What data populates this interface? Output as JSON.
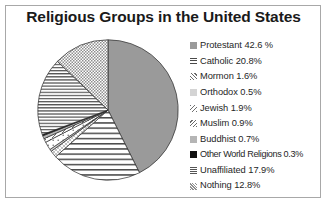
{
  "chart_data": {
    "type": "pie",
    "title": "Religious Groups in the United States",
    "xlabel": "",
    "ylabel": "",
    "legend_position": "right",
    "grid": false,
    "start_angle_deg": 0,
    "direction": "clockwise",
    "categories": [
      "Protestant",
      "Catholic",
      "Mormon",
      "Orthodox",
      "Jewish",
      "Muslim",
      "Buddhist",
      "Other World Religions",
      "Unaffiliated",
      "Nothing"
    ],
    "values": [
      42.6,
      20.8,
      1.6,
      0.5,
      1.9,
      0.9,
      0.7,
      0.3,
      17.9,
      12.8
    ],
    "slices": [
      {
        "label": "Protestant",
        "value": 42.6,
        "legend_text": "Protestant 42.6 %",
        "pattern": "solid-gray",
        "fill": "#9a9a9a"
      },
      {
        "label": "Catholic",
        "value": 20.8,
        "legend_text": "Catholic 20.8%",
        "pattern": "horizontal-lines-wide",
        "fill": "#ffffff"
      },
      {
        "label": "Mormon",
        "value": 1.6,
        "legend_text": "Mormon 1.6%",
        "pattern": "diagonal-dots",
        "fill": "#ffffff"
      },
      {
        "label": "Orthodox",
        "value": 0.5,
        "legend_text": "Orthodox 0.5%",
        "pattern": "light-gray",
        "fill": "#d4d4d4"
      },
      {
        "label": "Jewish",
        "value": 1.9,
        "legend_text": "Jewish 1.9%",
        "pattern": "sparse-dots",
        "fill": "#ffffff"
      },
      {
        "label": "Muslim",
        "value": 0.9,
        "legend_text": "Muslim 0.9%",
        "pattern": "diagonal-dash",
        "fill": "#ffffff"
      },
      {
        "label": "Buddhist",
        "value": 0.7,
        "legend_text": "Buddhist 0.7%",
        "pattern": "mid-gray",
        "fill": "#b5b5b5"
      },
      {
        "label": "Other World Religions",
        "value": 0.3,
        "legend_text": "Other World Religions 0.3%",
        "pattern": "solid-black",
        "fill": "#111111"
      },
      {
        "label": "Unaffiliated",
        "value": 17.9,
        "legend_text": "Unaffiliated 17.9%",
        "pattern": "horizontal-lines-dense",
        "fill": "#ffffff"
      },
      {
        "label": "Nothing",
        "value": 12.8,
        "legend_text": "Nothing 12.8%",
        "pattern": "checkered-fine",
        "fill": "#ffffff"
      }
    ]
  },
  "colors": {
    "border": "#a8a8a8",
    "title": "#1a1a1a",
    "legend_text": "#262626",
    "outline": "#2b2b2b",
    "background": "#ffffff"
  }
}
